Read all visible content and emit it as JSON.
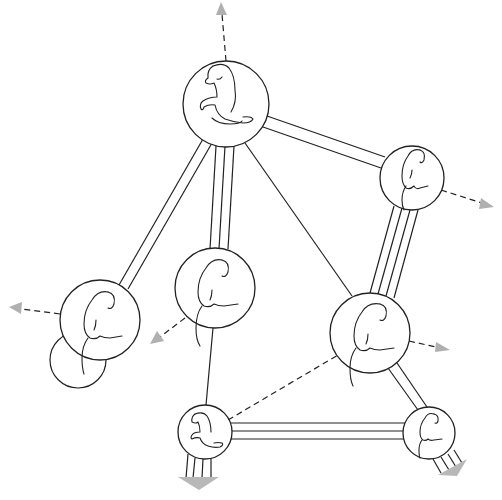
{
  "diagram": {
    "title": "",
    "colors": {
      "line": "#222222",
      "arrow_fill": "#b0b0b0",
      "background": "#ffffff"
    },
    "nodes": [
      {
        "id": "top",
        "cx": 226,
        "cy": 104,
        "r": 43,
        "pose": "sitting-profile-large"
      },
      {
        "id": "right-upper",
        "cx": 412,
        "cy": 178,
        "r": 32,
        "pose": "hunched"
      },
      {
        "id": "left",
        "cx": 100,
        "cy": 320,
        "r": 40,
        "pose": "hunched"
      },
      {
        "id": "center-left",
        "cx": 215,
        "cy": 288,
        "r": 40,
        "pose": "hunched"
      },
      {
        "id": "center-right",
        "cx": 370,
        "cy": 333,
        "r": 40,
        "pose": "hunched"
      },
      {
        "id": "bottom-left",
        "cx": 205,
        "cy": 432,
        "r": 27,
        "pose": "sitting-profile"
      },
      {
        "id": "bottom-right",
        "cx": 429,
        "cy": 433,
        "r": 26,
        "pose": "hunched"
      }
    ],
    "ghost_nodes": [
      {
        "id": "left-shadow",
        "cx": 78,
        "cy": 360,
        "r": 28
      }
    ],
    "links": [
      {
        "from": "top",
        "to": "right-upper",
        "lines": 2
      },
      {
        "from": "top",
        "to": "left",
        "lines": 2
      },
      {
        "from": "top",
        "to": "center-left",
        "lines": 3
      },
      {
        "from": "top",
        "to": "center-right",
        "lines": 1
      },
      {
        "from": "right-upper",
        "to": "center-right",
        "lines": 4
      },
      {
        "from": "center-left",
        "to": "bottom-left",
        "lines": 1
      },
      {
        "from": "bottom-left",
        "to": "bottom-right",
        "lines": 3
      },
      {
        "from": "center-right",
        "to": "bottom-right",
        "lines": 2
      }
    ],
    "dashed_links": [
      {
        "from": "bottom-left",
        "to": "center-right"
      }
    ],
    "outward_arrows": [
      {
        "from": "top",
        "direction": "up",
        "style": "dashed"
      },
      {
        "from": "right-upper",
        "direction": "right-down",
        "style": "dashed"
      },
      {
        "from": "left",
        "direction": "left",
        "style": "dashed"
      },
      {
        "from": "center-left",
        "direction": "left-down",
        "style": "dashed"
      },
      {
        "from": "center-right",
        "direction": "right",
        "style": "dashed"
      },
      {
        "from": "bottom-left",
        "direction": "down",
        "style": "band-4"
      },
      {
        "from": "bottom-right",
        "direction": "right-down",
        "style": "band-4"
      }
    ]
  }
}
